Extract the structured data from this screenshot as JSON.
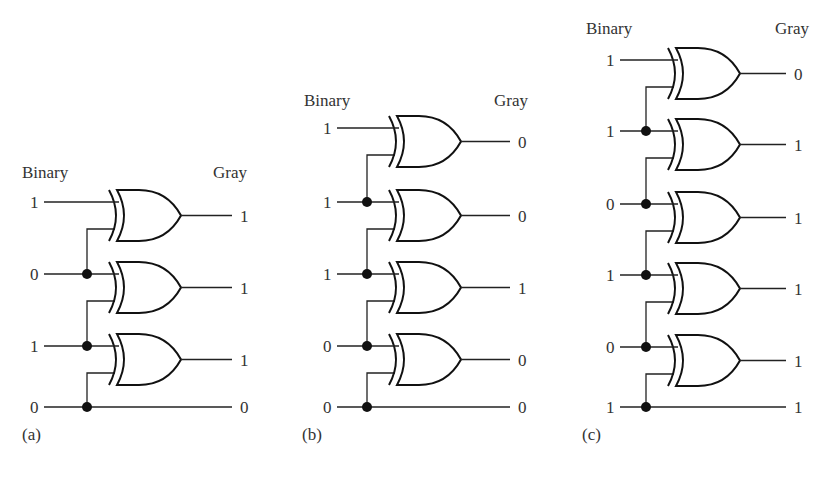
{
  "figure": {
    "column_headers": {
      "input": "Binary",
      "output": "Gray"
    },
    "circuits": [
      {
        "id": "a",
        "caption": "(a)",
        "binary": [
          "1",
          "0",
          "1",
          "0"
        ],
        "gray": [
          "1",
          "1",
          "1",
          "0"
        ],
        "xor_gate_count": 3
      },
      {
        "id": "b",
        "caption": "(b)",
        "binary": [
          "1",
          "1",
          "1",
          "0",
          "0"
        ],
        "gray": [
          "0",
          "0",
          "1",
          "0",
          "0"
        ],
        "xor_gate_count": 4
      },
      {
        "id": "c",
        "caption": "(c)",
        "binary": [
          "1",
          "1",
          "0",
          "1",
          "0",
          "1"
        ],
        "gray": [
          "0",
          "1",
          "1",
          "1",
          "1",
          "1"
        ],
        "xor_gate_count": 5
      }
    ]
  },
  "layout": {
    "circuits": [
      {
        "x0": 32,
        "rows": [
          202,
          274,
          346,
          407
        ],
        "gate_x": 109,
        "out_end": 232,
        "label_y": 178,
        "caption_x": 22,
        "caption_y": 440,
        "bin_lbl_x": 22,
        "gray_lbl_x": 213
      },
      {
        "x0": 325,
        "rows": [
          128,
          202,
          274,
          346,
          407
        ],
        "gate_x": 389,
        "out_end": 510,
        "label_y": 106,
        "caption_x": 302,
        "caption_y": 440,
        "bin_lbl_x": 304,
        "gray_lbl_x": 494
      },
      {
        "x0": 608,
        "rows": [
          60,
          131,
          204,
          275,
          347,
          407
        ],
        "gate_x": 668,
        "out_end": 786,
        "label_y": 34,
        "caption_x": 582,
        "caption_y": 440,
        "bin_lbl_x": 586,
        "gray_lbl_x": 775
      }
    ]
  }
}
